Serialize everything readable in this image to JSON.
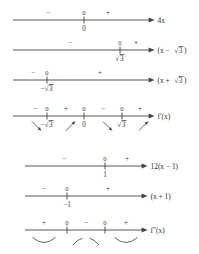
{
  "figure": {
    "axis_color": "#44444a",
    "text_color": "#3a3a40"
  },
  "plus": "+",
  "minus": "−",
  "zero": "0",
  "groups": [
    {
      "name": "first-derivative-group",
      "rows": [
        {
          "id": "row-4x",
          "label": "4x",
          "label_parts": {
            "prefix": "4x"
          },
          "line": {
            "x1": 13,
            "x2": 152
          },
          "signs": [
            {
              "text": "−",
              "x": 48
            },
            {
              "text": "+",
              "x": 108
            }
          ],
          "zeros": [
            {
              "text": "0",
              "x": 84
            }
          ],
          "ticks": [
            {
              "x": 84,
              "value": "0"
            }
          ]
        },
        {
          "id": "row-x-minus-sqrt3",
          "label": "(x − √3)",
          "line": {
            "x1": 13,
            "x2": 152
          },
          "signs": [
            {
              "text": "−",
              "x": 70
            },
            {
              "text": "+",
              "x": 136
            }
          ],
          "zeros": [
            {
              "text": "0",
              "x": 120
            }
          ],
          "ticks": [
            {
              "x": 120,
              "value": "√3"
            }
          ]
        },
        {
          "id": "row-x-plus-sqrt3",
          "label": "(x + √3)",
          "line": {
            "x1": 13,
            "x2": 152
          },
          "signs": [
            {
              "text": "−",
              "x": 33
            },
            {
              "text": "+",
              "x": 100
            }
          ],
          "zeros": [
            {
              "text": "0",
              "x": 47
            }
          ],
          "ticks": [
            {
              "x": 47,
              "value": "−√3"
            }
          ]
        },
        {
          "id": "row-f-prime",
          "label": "f′(x)",
          "line": {
            "x1": 13,
            "x2": 152
          },
          "signs": [
            {
              "text": "−",
              "x": 35
            },
            {
              "text": "+",
              "x": 66
            },
            {
              "text": "−",
              "x": 103
            },
            {
              "text": "+",
              "x": 140
            }
          ],
          "zeros": [
            {
              "text": "0",
              "x": 47
            },
            {
              "text": "0",
              "x": 84
            },
            {
              "text": "0",
              "x": 122
            }
          ],
          "ticks": [
            {
              "x": 47,
              "value": "−√3"
            },
            {
              "x": 84,
              "value": "0"
            },
            {
              "x": 122,
              "value": "√3"
            }
          ],
          "slope_arrows": [
            {
              "dir": "down",
              "x": 32
            },
            {
              "dir": "up",
              "x": 66
            },
            {
              "dir": "down",
              "x": 103
            },
            {
              "dir": "up",
              "x": 139
            }
          ]
        }
      ]
    },
    {
      "name": "second-derivative-group",
      "rows": [
        {
          "id": "row-12x-minus-1",
          "label": "12(x − 1)",
          "line": {
            "x1": 25,
            "x2": 145
          },
          "signs": [
            {
              "text": "−",
              "x": 64
            },
            {
              "text": "+",
              "x": 127
            }
          ],
          "zeros": [
            {
              "text": "0",
              "x": 105
            }
          ],
          "ticks": [
            {
              "x": 105,
              "value": "1"
            }
          ]
        },
        {
          "id": "row-x-plus-1",
          "label": "(x + 1)",
          "line": {
            "x1": 25,
            "x2": 145
          },
          "signs": [
            {
              "text": "−",
              "x": 44
            },
            {
              "text": "+",
              "x": 108
            }
          ],
          "zeros": [
            {
              "text": "0",
              "x": 67
            }
          ],
          "ticks": [
            {
              "x": 67,
              "value": "−1"
            }
          ]
        },
        {
          "id": "row-f-double-prime",
          "label": "f″(x)",
          "line": {
            "x1": 25,
            "x2": 145
          },
          "signs": [
            {
              "text": "+",
              "x": 44
            },
            {
              "text": "−",
              "x": 86
            },
            {
              "text": "+",
              "x": 126
            }
          ],
          "zeros": [
            {
              "text": "0",
              "x": 67
            },
            {
              "text": "0",
              "x": 105
            }
          ],
          "ticks": [
            {
              "x": 67,
              "value": ""
            },
            {
              "x": 105,
              "value": ""
            }
          ],
          "concavity": [
            {
              "shape": "cup",
              "x": 44
            },
            {
              "shape": "cap",
              "x": 86
            },
            {
              "shape": "cup",
              "x": 126
            }
          ]
        }
      ]
    }
  ]
}
